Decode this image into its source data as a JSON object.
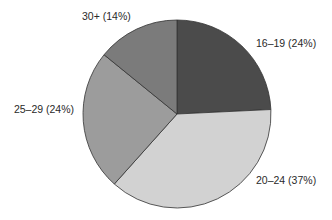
{
  "chart_data": {
    "type": "pie",
    "title": "",
    "categories": [
      "16–19",
      "20–24",
      "25–29",
      "30+"
    ],
    "values": [
      24,
      37,
      24,
      14
    ],
    "unit": "%",
    "labels": [
      "16–19 (24%)",
      "20–24 (37%)",
      "25–29 (24%)",
      "30+ (14%)"
    ],
    "colors": [
      "#4b4b4b",
      "#d2d2d2",
      "#9c9c9c",
      "#7b7b7b"
    ],
    "start_angle_deg": 0,
    "direction": "clockwise",
    "legend": "none (direct labels)"
  },
  "layout": {
    "cx": 177,
    "cy": 114,
    "r": 94,
    "label_positions": [
      {
        "x": 256,
        "y": 47,
        "anchor": "start"
      },
      {
        "x": 256,
        "y": 184,
        "anchor": "start"
      },
      {
        "x": 74,
        "y": 113,
        "anchor": "end"
      },
      {
        "x": 82,
        "y": 20,
        "anchor": "start"
      }
    ]
  }
}
